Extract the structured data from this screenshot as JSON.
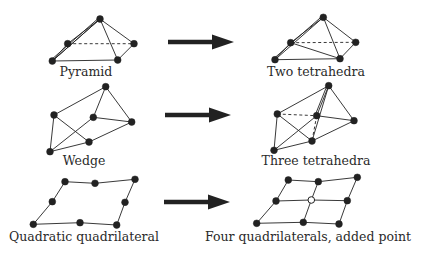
{
  "colors": {
    "ink": "#222222",
    "background": "#ffffff",
    "added_point_fill": "#ffffff"
  },
  "rows": [
    {
      "before": {
        "label": "Pyramid",
        "label_pos": [
          86,
          66
        ],
        "nodes": [
          [
            100,
            19
          ],
          [
            67.7,
            43.7
          ],
          [
            134,
            43.7
          ],
          [
            52.3,
            61
          ],
          [
            117.7,
            60
          ]
        ],
        "edges": [
          [
            0,
            1
          ],
          [
            0,
            2
          ],
          [
            0,
            3
          ],
          [
            0,
            4
          ],
          [
            1,
            3
          ],
          [
            3,
            4
          ],
          [
            4,
            2
          ],
          [
            0,
            3
          ]
        ],
        "double_edges": [
          [
            0,
            3
          ]
        ],
        "dashed_edges": [
          [
            1,
            2
          ]
        ]
      },
      "arrow": {
        "from": [
          168,
          42
        ],
        "to": [
          234,
          42
        ]
      },
      "after": {
        "label": "Two tetrahedra",
        "label_pos": [
          316,
          66
        ],
        "nodes": [
          [
            323.3,
            17.3
          ],
          [
            290.7,
            42.7
          ],
          [
            355.7,
            42.3
          ],
          [
            275,
            59.7
          ],
          [
            340,
            58.7
          ]
        ],
        "edges": [
          [
            0,
            1
          ],
          [
            0,
            2
          ],
          [
            0,
            3
          ],
          [
            0,
            4
          ],
          [
            1,
            3
          ],
          [
            3,
            4
          ],
          [
            4,
            2
          ],
          [
            1,
            4
          ]
        ],
        "double_edges": [
          [
            0,
            3
          ]
        ],
        "dashed_edges": [
          [
            1,
            2
          ]
        ]
      }
    },
    {
      "before": {
        "label": "Wedge",
        "label_pos": [
          84,
          155
        ],
        "nodes": [
          [
            105.7,
            86.7
          ],
          [
            54,
            115
          ],
          [
            93.3,
            117.3
          ],
          [
            131.7,
            122
          ],
          [
            89,
            142
          ],
          [
            50,
            151.7
          ]
        ],
        "edges": [
          [
            0,
            1
          ],
          [
            0,
            2
          ],
          [
            0,
            3
          ],
          [
            1,
            4
          ],
          [
            1,
            5
          ],
          [
            2,
            3
          ],
          [
            2,
            5
          ],
          [
            3,
            4
          ],
          [
            4,
            5
          ]
        ],
        "double_edges": [],
        "dashed_edges": []
      },
      "arrow": {
        "from": [
          165,
          115
        ],
        "to": [
          231,
          115
        ]
      },
      "after": {
        "label": "Three tetrahedra",
        "label_pos": [
          316,
          155
        ],
        "nodes": [
          [
            328.7,
            85.7
          ],
          [
            277.3,
            114
          ],
          [
            316.7,
            115.7
          ],
          [
            354,
            120.7
          ],
          [
            312,
            141
          ],
          [
            274,
            150.3
          ]
        ],
        "edges": [
          [
            0,
            1
          ],
          [
            0,
            2
          ],
          [
            0,
            3
          ],
          [
            1,
            4
          ],
          [
            1,
            5
          ],
          [
            2,
            3
          ],
          [
            2,
            5
          ],
          [
            3,
            4
          ],
          [
            4,
            5
          ],
          [
            0,
            4
          ]
        ],
        "double_edges": [
          [
            0,
            2
          ]
        ],
        "dashed_edges": [
          [
            1,
            2
          ],
          [
            2,
            4
          ]
        ]
      }
    },
    {
      "before": {
        "label": "Quadratic quadrilateral",
        "label_pos": [
          84,
          231
        ],
        "nodes": [
          [
            65,
            181.7
          ],
          [
            95,
            183.3
          ],
          [
            135,
            179.3
          ],
          [
            52.3,
            201.7
          ],
          [
            125,
            202.3
          ],
          [
            33.3,
            224.3
          ],
          [
            80,
            222.7
          ],
          [
            116.7,
            225
          ]
        ],
        "edges": [
          [
            0,
            1
          ],
          [
            1,
            2
          ],
          [
            2,
            4
          ],
          [
            4,
            7
          ],
          [
            7,
            6
          ],
          [
            6,
            5
          ],
          [
            5,
            3
          ],
          [
            3,
            0
          ]
        ],
        "double_edges": [],
        "dashed_edges": []
      },
      "arrow": {
        "from": [
          164,
          202
        ],
        "to": [
          230,
          202
        ]
      },
      "after": {
        "label": "Four quadrilaterals, added point",
        "label_pos": [
          308,
          231
        ],
        "nodes": [
          [
            288.3,
            180
          ],
          [
            318.3,
            181.7
          ],
          [
            357.3,
            177.3
          ],
          [
            276,
            201
          ],
          [
            347.3,
            200.7
          ],
          [
            256.7,
            223.3
          ],
          [
            303.3,
            222.3
          ],
          [
            339,
            224
          ],
          [
            311.3,
            200
          ]
        ],
        "hollow_nodes": [
          8
        ],
        "edges": [
          [
            0,
            1
          ],
          [
            1,
            2
          ],
          [
            2,
            4
          ],
          [
            4,
            7
          ],
          [
            7,
            6
          ],
          [
            6,
            5
          ],
          [
            5,
            3
          ],
          [
            3,
            0
          ],
          [
            1,
            8
          ],
          [
            8,
            6
          ],
          [
            3,
            8
          ],
          [
            8,
            4
          ]
        ],
        "double_edges": [],
        "dashed_edges": []
      }
    }
  ]
}
